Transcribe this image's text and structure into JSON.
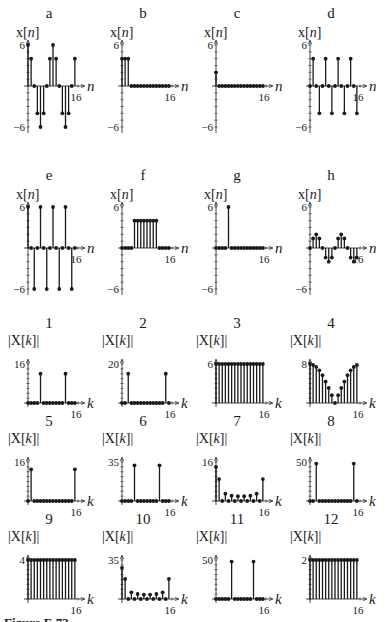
{
  "caption": "Figure E.73",
  "chart_data": [
    {
      "id": "a",
      "type": "stem",
      "title": "a",
      "ylabel": "x[n]",
      "xlabel": "n",
      "ylim": [
        -6,
        6
      ],
      "ytick_top": "6",
      "ytick_bottom": "−6",
      "xtick": "16",
      "x": [
        0,
        1,
        2,
        3,
        4,
        5,
        6,
        7,
        8,
        9,
        10,
        11,
        12,
        13,
        14,
        15
      ],
      "values": [
        6,
        4,
        0,
        -4,
        -6,
        -4,
        0,
        4,
        6,
        4,
        0,
        -4,
        -6,
        -4,
        0,
        4
      ]
    },
    {
      "id": "b",
      "type": "stem",
      "title": "b",
      "ylabel": "x[n]",
      "xlabel": "n",
      "ylim": [
        -6,
        6
      ],
      "ytick_top": "6",
      "ytick_bottom": "−6",
      "xtick": "16",
      "x": [
        0,
        1,
        2,
        3,
        4,
        5,
        6,
        7,
        8,
        9,
        10,
        11,
        12,
        13,
        14,
        15
      ],
      "values": [
        4,
        4,
        4,
        0,
        0,
        0,
        0,
        0,
        0,
        0,
        0,
        0,
        0,
        0,
        0,
        0
      ]
    },
    {
      "id": "c",
      "type": "stem",
      "title": "c",
      "ylabel": "x[n]",
      "xlabel": "n",
      "ylim": [
        -6,
        6
      ],
      "ytick_top": "6",
      "ytick_bottom": "−6",
      "xtick": "16",
      "x": [
        0,
        1,
        2,
        3,
        4,
        5,
        6,
        7,
        8,
        9,
        10,
        11,
        12,
        13,
        14,
        15
      ],
      "values": [
        2,
        0,
        0,
        0,
        0,
        0,
        0,
        0,
        0,
        0,
        0,
        0,
        0,
        0,
        0,
        0
      ]
    },
    {
      "id": "d",
      "type": "stem",
      "title": "d",
      "ylabel": "x[n]",
      "xlabel": "n",
      "ylim": [
        -6,
        6
      ],
      "ytick_top": "6",
      "ytick_bottom": "−6",
      "xtick": "16",
      "x": [
        0,
        1,
        2,
        3,
        4,
        5,
        6,
        7,
        8,
        9,
        10,
        11,
        12,
        13,
        14,
        15
      ],
      "values": [
        0,
        4,
        0,
        -4,
        0,
        4,
        0,
        -4,
        0,
        4,
        0,
        -4,
        0,
        4,
        0,
        -4
      ]
    },
    {
      "id": "e",
      "type": "stem",
      "title": "e",
      "ylabel": "x[n]",
      "xlabel": "n",
      "ylim": [
        -6,
        6
      ],
      "ytick_top": "6",
      "ytick_bottom": "−6",
      "xtick": "16",
      "x": [
        0,
        1,
        2,
        3,
        4,
        5,
        6,
        7,
        8,
        9,
        10,
        11,
        12,
        13,
        14,
        15
      ],
      "values": [
        6,
        0,
        -6,
        0,
        6,
        0,
        -6,
        0,
        6,
        0,
        -6,
        0,
        6,
        0,
        -6,
        0
      ]
    },
    {
      "id": "f",
      "type": "stem",
      "title": "f",
      "ylabel": "x[n]",
      "xlabel": "n",
      "ylim": [
        -6,
        6
      ],
      "ytick_top": "6",
      "ytick_bottom": "−6",
      "xtick": "16",
      "x": [
        0,
        1,
        2,
        3,
        4,
        5,
        6,
        7,
        8,
        9,
        10,
        11,
        12,
        13,
        14,
        15
      ],
      "values": [
        0,
        0,
        0,
        0,
        4,
        4,
        4,
        4,
        4,
        4,
        4,
        4,
        0,
        0,
        0,
        0
      ]
    },
    {
      "id": "g",
      "type": "stem",
      "title": "g",
      "ylabel": "x[n]",
      "xlabel": "n",
      "ylim": [
        -6,
        6
      ],
      "ytick_top": "6",
      "ytick_bottom": "−6",
      "xtick": "16",
      "x": [
        0,
        1,
        2,
        3,
        4,
        5,
        6,
        7,
        8,
        9,
        10,
        11,
        12,
        13,
        14,
        15
      ],
      "values": [
        0,
        0,
        0,
        0,
        6,
        0,
        0,
        0,
        0,
        0,
        0,
        0,
        0,
        0,
        0,
        0
      ]
    },
    {
      "id": "h",
      "type": "stem",
      "title": "h",
      "ylabel": "x[n]",
      "xlabel": "n",
      "ylim": [
        -6,
        6
      ],
      "ytick_top": "6",
      "ytick_bottom": "−6",
      "xtick": "16",
      "x": [
        0,
        1,
        2,
        3,
        4,
        5,
        6,
        7,
        8,
        9,
        10,
        11,
        12,
        13,
        14,
        15
      ],
      "values": [
        0,
        1.4,
        2,
        1.4,
        0,
        -1.4,
        -2,
        -1.4,
        0,
        1.4,
        2,
        1.4,
        0,
        -1.4,
        -2,
        -1.4
      ]
    },
    {
      "id": "1",
      "type": "stem",
      "title": "1",
      "ylabel": "|X[k]|",
      "xlabel": "k",
      "ylim": [
        0,
        16
      ],
      "ytick_top": "16",
      "xtick": "16",
      "x": [
        0,
        1,
        2,
        3,
        4,
        5,
        6,
        7,
        8,
        9,
        10,
        11,
        12,
        13,
        14,
        15
      ],
      "values": [
        0,
        0,
        0,
        0,
        12,
        0,
        0,
        0,
        0,
        0,
        0,
        0,
        12,
        0,
        0,
        0
      ]
    },
    {
      "id": "2",
      "type": "stem",
      "title": "2",
      "ylabel": "|X[k]|",
      "xlabel": "k",
      "ylim": [
        0,
        20
      ],
      "ytick_top": "20",
      "xtick": "16",
      "x": [
        0,
        1,
        2,
        3,
        4,
        5,
        6,
        7,
        8,
        9,
        10,
        11,
        12,
        13,
        14,
        15
      ],
      "values": [
        0,
        0,
        15,
        0,
        0,
        0,
        0,
        0,
        0,
        0,
        0,
        0,
        0,
        0,
        15,
        0
      ]
    },
    {
      "id": "3",
      "type": "stem",
      "title": "3",
      "ylabel": "|X[k]|",
      "xlabel": "k",
      "ylim": [
        0,
        6
      ],
      "ytick_top": "6",
      "xtick": "16",
      "x": [
        0,
        1,
        2,
        3,
        4,
        5,
        6,
        7,
        8,
        9,
        10,
        11,
        12,
        13,
        14,
        15
      ],
      "values": [
        6,
        6,
        6,
        6,
        6,
        6,
        6,
        6,
        6,
        6,
        6,
        6,
        6,
        6,
        6,
        6
      ]
    },
    {
      "id": "4",
      "type": "stem",
      "title": "4",
      "ylabel": "|X[k]|",
      "xlabel": "k",
      "ylim": [
        0,
        8
      ],
      "ytick_top": "8",
      "xtick": "16",
      "x": [
        0,
        1,
        2,
        3,
        4,
        5,
        6,
        7,
        8,
        9,
        10,
        11,
        12,
        13,
        14,
        15
      ],
      "values": [
        8,
        7.8,
        7.4,
        6.7,
        5.7,
        4.4,
        3.1,
        1.6,
        0,
        1.6,
        3.1,
        4.4,
        5.7,
        6.7,
        7.4,
        7.8
      ]
    },
    {
      "id": "5",
      "type": "stem",
      "title": "5",
      "ylabel": "|X[k]|",
      "xlabel": "k",
      "ylim": [
        0,
        16
      ],
      "ytick_top": "16",
      "xtick": "16",
      "x": [
        0,
        1,
        2,
        3,
        4,
        5,
        6,
        7,
        8,
        9,
        10,
        11,
        12,
        13,
        14,
        15
      ],
      "values": [
        0,
        13,
        0,
        0,
        0,
        0,
        0,
        0,
        0,
        0,
        0,
        0,
        0,
        0,
        0,
        13
      ]
    },
    {
      "id": "6",
      "type": "stem",
      "title": "6",
      "ylabel": "|X[k]|",
      "xlabel": "k",
      "ylim": [
        0,
        35
      ],
      "ytick_top": "35",
      "xtick": "16",
      "x": [
        0,
        1,
        2,
        3,
        4,
        5,
        6,
        7,
        8,
        9,
        10,
        11,
        12,
        13,
        14,
        15
      ],
      "values": [
        0,
        0,
        0,
        0,
        32,
        0,
        0,
        0,
        0,
        0,
        0,
        0,
        32,
        0,
        0,
        0
      ]
    },
    {
      "id": "7",
      "type": "stem",
      "title": "7",
      "ylabel": "|X[k]|",
      "xlabel": "k",
      "ylim": [
        0,
        16
      ],
      "ytick_top": "16",
      "xtick": "16",
      "x": [
        0,
        1,
        2,
        3,
        4,
        5,
        6,
        7,
        8,
        9,
        10,
        11,
        12,
        13,
        14,
        15
      ],
      "values": [
        14,
        9,
        0,
        3,
        0,
        2.2,
        0,
        2,
        0,
        2,
        0,
        2.2,
        0,
        3,
        0,
        9
      ]
    },
    {
      "id": "8",
      "type": "stem",
      "title": "8",
      "ylabel": "|X[k]|",
      "xlabel": "k",
      "ylim": [
        0,
        50
      ],
      "ytick_top": "50",
      "xtick": "16",
      "x": [
        0,
        1,
        2,
        3,
        4,
        5,
        6,
        7,
        8,
        9,
        10,
        11,
        12,
        13,
        14,
        15
      ],
      "values": [
        0,
        0,
        48,
        0,
        0,
        0,
        0,
        0,
        0,
        0,
        0,
        0,
        0,
        0,
        48,
        0
      ]
    },
    {
      "id": "9",
      "type": "stem",
      "title": "9",
      "ylabel": "|X[k]|",
      "xlabel": "k",
      "ylim": [
        0,
        4
      ],
      "ytick_top": "4",
      "xtick": "16",
      "x": [
        0,
        1,
        2,
        3,
        4,
        5,
        6,
        7,
        8,
        9,
        10,
        11,
        12,
        13,
        14,
        15
      ],
      "values": [
        4,
        4,
        4,
        4,
        4,
        4,
        4,
        4,
        4,
        4,
        4,
        4,
        4,
        4,
        4,
        4
      ]
    },
    {
      "id": "10",
      "type": "stem",
      "title": "10",
      "ylabel": "|X[k]|",
      "xlabel": "k",
      "ylim": [
        0,
        35
      ],
      "ytick_top": "35",
      "xtick": "16",
      "x": [
        0,
        1,
        2,
        3,
        4,
        5,
        6,
        7,
        8,
        9,
        10,
        11,
        12,
        13,
        14,
        15
      ],
      "values": [
        28,
        18,
        0,
        6,
        0,
        4.5,
        0,
        4,
        0,
        4,
        0,
        4.5,
        0,
        6,
        0,
        18
      ]
    },
    {
      "id": "11",
      "type": "stem",
      "title": "11",
      "ylabel": "|X[k]|",
      "xlabel": "k",
      "ylim": [
        0,
        50
      ],
      "ytick_top": "50",
      "xtick": "16",
      "x": [
        0,
        1,
        2,
        3,
        4,
        5,
        6,
        7,
        8,
        9,
        10,
        11,
        12,
        13,
        14,
        15
      ],
      "values": [
        0,
        0,
        0,
        0,
        0,
        48,
        0,
        0,
        0,
        0,
        0,
        0,
        48,
        0,
        0,
        0
      ]
    },
    {
      "id": "12",
      "type": "stem",
      "title": "12",
      "ylabel": "|X[k]|",
      "xlabel": "k",
      "ylim": [
        0,
        2
      ],
      "ytick_top": "2",
      "xtick": "16",
      "x": [
        0,
        1,
        2,
        3,
        4,
        5,
        6,
        7,
        8,
        9,
        10,
        11,
        12,
        13,
        14,
        15
      ],
      "values": [
        2,
        2,
        2,
        2,
        2,
        2,
        2,
        2,
        2,
        2,
        2,
        2,
        2,
        2,
        2,
        2
      ]
    }
  ],
  "layout": {
    "time_panels": [
      {
        "left": 2,
        "top": 0
      },
      {
        "left": 96,
        "top": 0
      },
      {
        "left": 190,
        "top": 0
      },
      {
        "left": 284,
        "top": 0
      },
      {
        "left": 2,
        "top": 162
      },
      {
        "left": 96,
        "top": 162
      },
      {
        "left": 190,
        "top": 162
      },
      {
        "left": 284,
        "top": 162
      }
    ],
    "freq_panels": [
      {
        "left": 2,
        "top": 312
      },
      {
        "left": 96,
        "top": 312
      },
      {
        "left": 190,
        "top": 312
      },
      {
        "left": 284,
        "top": 312
      },
      {
        "left": 2,
        "top": 410
      },
      {
        "left": 96,
        "top": 410
      },
      {
        "left": 190,
        "top": 410
      },
      {
        "left": 284,
        "top": 410
      },
      {
        "left": 2,
        "top": 508
      },
      {
        "left": 96,
        "top": 508
      },
      {
        "left": 190,
        "top": 508
      },
      {
        "left": 284,
        "top": 508
      }
    ]
  }
}
